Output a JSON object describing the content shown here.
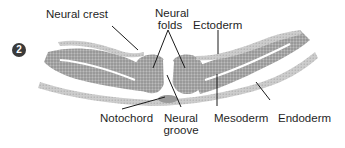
{
  "figure": {
    "step_number": "2",
    "labels": {
      "neural_crest": "Neural crest",
      "neural_folds_line1": "Neural",
      "neural_folds_line2": "folds",
      "ectoderm": "Ectoderm",
      "notochord": "Notochord",
      "neural_groove_line1": "Neural",
      "neural_groove_line2": "groove",
      "mesoderm": "Mesoderm",
      "endoderm": "Endoderm"
    },
    "colors": {
      "tissue_dark": "#8f8f8f",
      "tissue_mid": "#b3b3b3",
      "tissue_light": "#cfcfcf",
      "leader_line": "#1a1a1a",
      "badge": "#3a3a3a"
    }
  }
}
